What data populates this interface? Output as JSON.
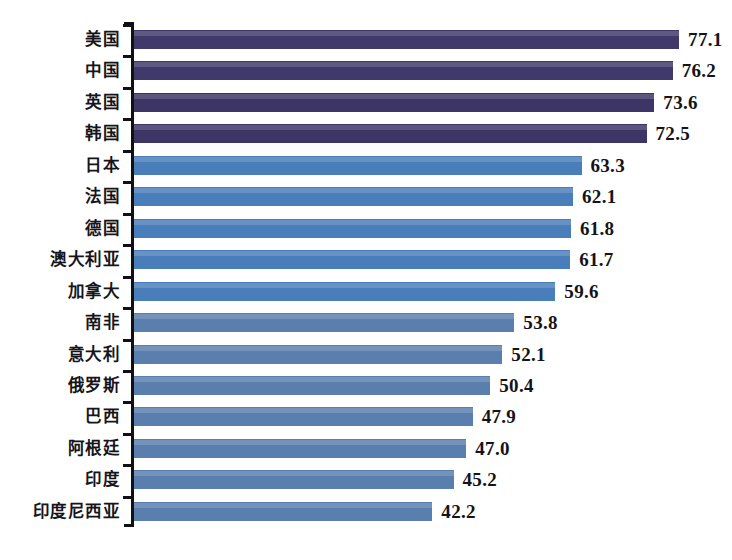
{
  "chart_data": {
    "type": "bar",
    "orientation": "horizontal",
    "title": "",
    "subtitle": "",
    "xlabel": "",
    "ylabel": "",
    "xlim": [
      0,
      81
    ],
    "grid": false,
    "legend": false,
    "categories": [
      "美国",
      "中国",
      "英国",
      "韩国",
      "日本",
      "法国",
      "德国",
      "澳大利亚",
      "加拿大",
      "南非",
      "意大利",
      "俄罗斯",
      "巴西",
      "阿根廷",
      "印度",
      "印度尼西亚"
    ],
    "values": [
      77.1,
      76.2,
      73.6,
      72.5,
      63.3,
      62.1,
      61.8,
      61.7,
      59.6,
      53.8,
      52.1,
      50.4,
      47.9,
      47.0,
      45.2,
      42.2
    ],
    "value_labels": [
      "77.1",
      "76.2",
      "73.6",
      "72.5",
      "63.3",
      "62.1",
      "61.8",
      "61.7",
      "59.6",
      "53.8",
      "52.1",
      "50.4",
      "47.9",
      "47.0",
      "45.2",
      "42.2"
    ],
    "bar_colors": [
      "#403a6b",
      "#403a6b",
      "#3d3566",
      "#3d3566",
      "#4a7ebb",
      "#4a7ebb",
      "#4a7ebb",
      "#4a7ebb",
      "#4a7ebb",
      "#5a7fae",
      "#5a7fae",
      "#5a7fae",
      "#5a7fae",
      "#5a7fae",
      "#5a7fae",
      "#5a7fae"
    ],
    "color_groups": [
      {
        "name": "dark-navy-group",
        "color": "#403a6b",
        "categories": [
          "美国",
          "中国",
          "英国",
          "韩国"
        ]
      },
      {
        "name": "bright-blue-group",
        "color": "#4a7ebb",
        "categories": [
          "日本",
          "法国",
          "德国",
          "澳大利亚",
          "加拿大"
        ]
      },
      {
        "name": "muted-blue-group",
        "color": "#5a7fae",
        "categories": [
          "南非",
          "意大利",
          "俄罗斯",
          "巴西",
          "阿根廷",
          "印度",
          "印度尼西亚"
        ]
      }
    ],
    "axis_color": "#111014",
    "background_color": "#ffffff"
  }
}
